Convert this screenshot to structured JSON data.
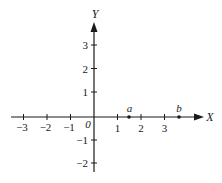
{
  "diagram": {
    "type": "cartesian-axes",
    "x_axis": {
      "name": "X",
      "ticks": [
        {
          "value": -3,
          "label": "−3"
        },
        {
          "value": -2,
          "label": "−2"
        },
        {
          "value": -1,
          "label": "−1"
        },
        {
          "value": 1,
          "label": "1"
        },
        {
          "value": 2,
          "label": "2"
        },
        {
          "value": 3,
          "label": "3"
        }
      ],
      "origin_label": "0"
    },
    "y_axis": {
      "name": "Y",
      "ticks": [
        {
          "value": 3,
          "label": "3"
        },
        {
          "value": 2,
          "label": "2"
        },
        {
          "value": 1,
          "label": "1"
        },
        {
          "value": -1,
          "label": "−1"
        },
        {
          "value": -2,
          "label": "−2"
        }
      ]
    },
    "points": [
      {
        "name": "a",
        "x": 1.5,
        "y": 0
      },
      {
        "name": "b",
        "x": 3.7,
        "y": 0
      }
    ],
    "colors": {
      "ink": "#1a1a1a",
      "background": "#ffffff"
    }
  }
}
